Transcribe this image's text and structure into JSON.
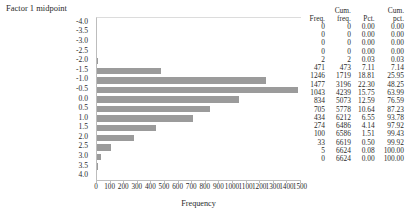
{
  "chart_data": {
    "type": "bar",
    "orientation": "horizontal",
    "title": "Factor 1 midpoint",
    "xlabel": "Frequency",
    "ylabel": "",
    "xlim": [
      0,
      1500
    ],
    "xticks": [
      0,
      100,
      200,
      300,
      400,
      500,
      600,
      700,
      800,
      900,
      1000,
      1100,
      1200,
      1300,
      1400,
      1500
    ],
    "xticklabels": [
      "0",
      "100",
      "200",
      "300",
      "400",
      "500",
      "600",
      "700",
      "800",
      "900",
      "1000",
      "1100",
      "1200",
      "1300",
      "1400",
      "1500"
    ],
    "grid": false,
    "legend": null,
    "categories": [
      "-4.0",
      "-3.5",
      "-3.0",
      "-2.5",
      "-2.0",
      "-1.5",
      "-1.0",
      "-0.5",
      "0.0",
      "0.5",
      "1.0",
      "1.5",
      "2.0",
      "2.5",
      "3.0",
      "3.5",
      "4.0"
    ],
    "values": [
      0,
      0,
      0,
      0,
      2,
      471,
      1246,
      1477,
      1043,
      834,
      705,
      434,
      274,
      100,
      33,
      5,
      0
    ]
  },
  "chart": {
    "title": "Factor 1 midpoint",
    "xaxis_title": "Frequency",
    "bar_color": "#9b9b9b",
    "axis_color": "#bdbdbd"
  },
  "table": {
    "headers": {
      "freq_top": "",
      "freq": "Freq.",
      "cumfreq_top": "Cum.",
      "cumfreq": "freq.",
      "pct_top": "",
      "pct": "Pct.",
      "cumpct_top": "Cum.",
      "cumpct": "pct."
    },
    "rows": [
      {
        "freq": "0",
        "cumfreq": "0",
        "pct": "0.00",
        "cumpct": "0.00"
      },
      {
        "freq": "0",
        "cumfreq": "0",
        "pct": "0.00",
        "cumpct": "0.00"
      },
      {
        "freq": "0",
        "cumfreq": "0",
        "pct": "0.00",
        "cumpct": "0.00"
      },
      {
        "freq": "0",
        "cumfreq": "0",
        "pct": "0.00",
        "cumpct": "0.00"
      },
      {
        "freq": "2",
        "cumfreq": "2",
        "pct": "0.03",
        "cumpct": "0.03"
      },
      {
        "freq": "471",
        "cumfreq": "473",
        "pct": "7.11",
        "cumpct": "7.14"
      },
      {
        "freq": "1246",
        "cumfreq": "1719",
        "pct": "18.81",
        "cumpct": "25.95"
      },
      {
        "freq": "1477",
        "cumfreq": "3196",
        "pct": "22.30",
        "cumpct": "48.25"
      },
      {
        "freq": "1043",
        "cumfreq": "4239",
        "pct": "15.75",
        "cumpct": "63.99"
      },
      {
        "freq": "834",
        "cumfreq": "5073",
        "pct": "12.59",
        "cumpct": "76.59"
      },
      {
        "freq": "705",
        "cumfreq": "5778",
        "pct": "10.64",
        "cumpct": "87.23"
      },
      {
        "freq": "434",
        "cumfreq": "6212",
        "pct": "6.55",
        "cumpct": "93.78"
      },
      {
        "freq": "274",
        "cumfreq": "6486",
        "pct": "4.14",
        "cumpct": "97.92"
      },
      {
        "freq": "100",
        "cumfreq": "6586",
        "pct": "1.51",
        "cumpct": "99.43"
      },
      {
        "freq": "33",
        "cumfreq": "6619",
        "pct": "0.50",
        "cumpct": "99.92"
      },
      {
        "freq": "5",
        "cumfreq": "6624",
        "pct": "0.08",
        "cumpct": "100.00"
      },
      {
        "freq": "0",
        "cumfreq": "6624",
        "pct": "0.00",
        "cumpct": "100.00"
      }
    ]
  }
}
